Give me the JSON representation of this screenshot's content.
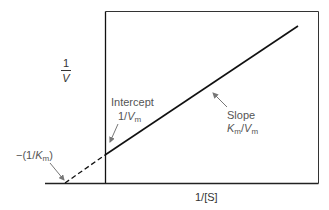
{
  "diagram": {
    "type": "lineweaver-burk-plot",
    "y_axis_label": {
      "numerator": "1",
      "denominator": "V"
    },
    "x_axis_label": "1/[S]",
    "intercept_label": {
      "title": "Intercept",
      "value_prefix": "1/",
      "value_var": "V",
      "value_sub": "m"
    },
    "slope_label": {
      "title": "Slope",
      "num_var": "K",
      "num_sub": "m",
      "sep": "/",
      "den_var": "V",
      "den_sub": "m"
    },
    "x_intercept_label": {
      "prefix": "−(1/",
      "var": "K",
      "sub": "m",
      "suffix": ")"
    },
    "colors": {
      "line": "#111111",
      "text": "#555555",
      "arrow": "#777777",
      "frame": "#222222"
    }
  }
}
